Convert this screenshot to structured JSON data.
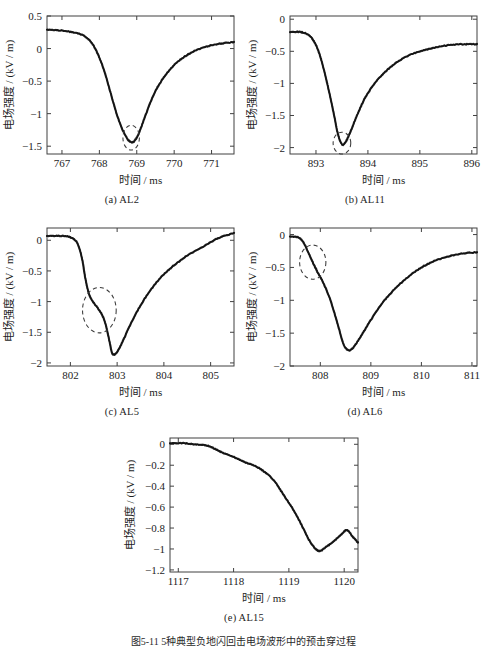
{
  "figure": {
    "caption": "图5-11  5种典型负地闪回击电场波形中的预击穿过程",
    "panel_count": 5
  },
  "common": {
    "xlabel": "时间 / ms",
    "ylabel": "电场强度 / (kV / m)",
    "annotation_name": "dashed-highlight-circle",
    "line_color": "#111111",
    "axis_color": "#404040"
  },
  "chart_data": [
    {
      "type": "line",
      "id": "AL2",
      "panel_label": "(a) AL2",
      "title": "",
      "xlabel": "时间 / ms",
      "ylabel": "电场强度 / (kV / m)",
      "xlim": [
        766.6,
        771.6
      ],
      "ylim": [
        -1.62,
        0.5
      ],
      "xticks": [
        767,
        768,
        769,
        770,
        771
      ],
      "yticks": [
        0.5,
        0,
        -0.5,
        -1,
        -1.5
      ],
      "ytick_labels": [
        "0.5",
        "0",
        "-0.5",
        "-1",
        "-1.5"
      ],
      "grid": false,
      "legend": "none",
      "annotation": {
        "shape": "dashed-ellipse",
        "x_center": 768.85,
        "y_center": -1.37,
        "x_radius": 0.22,
        "y_radius": 0.19,
        "note": "preliminary breakdown pulse at waveform trough"
      },
      "x": [
        766.6,
        766.9,
        767.2,
        767.5,
        767.7,
        767.85,
        768.0,
        768.15,
        768.3,
        768.45,
        768.6,
        768.72,
        768.8,
        768.88,
        768.95,
        769.05,
        769.2,
        769.4,
        769.6,
        769.85,
        770.1,
        770.4,
        770.7,
        771.0,
        771.3,
        771.6
      ],
      "y": [
        0.29,
        0.28,
        0.26,
        0.22,
        0.15,
        0.04,
        -0.14,
        -0.38,
        -0.68,
        -0.98,
        -1.22,
        -1.36,
        -1.42,
        -1.44,
        -1.41,
        -1.31,
        -1.08,
        -0.78,
        -0.55,
        -0.35,
        -0.2,
        -0.08,
        0.0,
        0.05,
        0.08,
        0.1
      ]
    },
    {
      "type": "line",
      "id": "AL11",
      "panel_label": "(b) AL11",
      "title": "",
      "xlabel": "时间 / ms",
      "ylabel": "电场强度 / (kV / m)",
      "xlim": [
        892.5,
        896.1
      ],
      "ylim": [
        -2.1,
        0.05
      ],
      "xticks": [
        893,
        894,
        895,
        896
      ],
      "yticks": [
        0,
        -0.5,
        -1,
        -1.5,
        -2
      ],
      "ytick_labels": [
        "0",
        "-0.5",
        "-1",
        "-1.5",
        "-2"
      ],
      "grid": false,
      "legend": "none",
      "annotation": {
        "shape": "dashed-ellipse",
        "x_center": 893.5,
        "y_center": -1.93,
        "x_radius": 0.17,
        "y_radius": 0.17,
        "note": "preliminary breakdown pulse at waveform trough"
      },
      "x": [
        892.5,
        892.7,
        892.85,
        892.95,
        893.05,
        893.15,
        893.25,
        893.35,
        893.42,
        893.5,
        893.58,
        893.68,
        893.8,
        893.95,
        894.15,
        894.4,
        894.7,
        895.0,
        895.3,
        895.6,
        895.85,
        896.1
      ],
      "y": [
        -0.2,
        -0.2,
        -0.24,
        -0.33,
        -0.5,
        -0.78,
        -1.12,
        -1.5,
        -1.78,
        -1.95,
        -1.9,
        -1.72,
        -1.48,
        -1.22,
        -0.98,
        -0.77,
        -0.6,
        -0.5,
        -0.44,
        -0.4,
        -0.39,
        -0.39
      ]
    },
    {
      "type": "line",
      "id": "AL5",
      "panel_label": "(c) AL5",
      "title": "",
      "xlabel": "时间 / ms",
      "ylabel": "电场强度 / (kV / m)",
      "xlim": [
        801.5,
        805.5
      ],
      "ylim": [
        -2.05,
        0.2
      ],
      "xticks": [
        802,
        803,
        804,
        805
      ],
      "yticks": [
        0,
        -0.5,
        -1,
        -1.5,
        -2
      ],
      "ytick_labels": [
        "0",
        "-0.5",
        "-1",
        "-1.5",
        "-2"
      ],
      "grid": false,
      "legend": "none",
      "annotation": {
        "shape": "dashed-ellipse",
        "x_center": 802.62,
        "y_center": -1.14,
        "x_radius": 0.36,
        "y_radius": 0.37,
        "note": "pronounced preliminary breakdown step on leading edge"
      },
      "x": [
        801.5,
        801.8,
        802.0,
        802.15,
        802.25,
        802.32,
        802.4,
        802.5,
        802.6,
        802.7,
        802.78,
        802.85,
        802.9,
        802.98,
        803.1,
        803.3,
        803.55,
        803.85,
        804.15,
        804.5,
        804.85,
        805.15,
        805.5
      ],
      "y": [
        0.07,
        0.07,
        0.05,
        -0.05,
        -0.3,
        -0.62,
        -0.88,
        -1.02,
        -1.12,
        -1.25,
        -1.45,
        -1.7,
        -1.85,
        -1.84,
        -1.68,
        -1.35,
        -1.0,
        -0.68,
        -0.45,
        -0.25,
        -0.1,
        0.03,
        0.12
      ]
    },
    {
      "type": "line",
      "id": "AL6",
      "panel_label": "(d) AL6",
      "title": "",
      "xlabel": "时间 / ms",
      "ylabel": "电场强度 / (kV / m)",
      "xlim": [
        807.4,
        811.1
      ],
      "ylim": [
        -2.0,
        0.1
      ],
      "xticks": [
        808,
        809,
        810,
        811
      ],
      "yticks": [
        0,
        -0.5,
        -1,
        -1.5,
        -2
      ],
      "ytick_labels": [
        "0",
        "-0.5",
        "-1",
        "-1.5",
        "-2"
      ],
      "grid": false,
      "legend": "none",
      "annotation": {
        "shape": "dashed-ellipse",
        "x_center": 807.85,
        "y_center": -0.42,
        "x_radius": 0.26,
        "y_radius": 0.26,
        "note": "preliminary breakdown step on leading edge"
      },
      "x": [
        807.4,
        807.55,
        807.65,
        807.75,
        807.85,
        807.95,
        808.05,
        808.2,
        808.35,
        808.45,
        808.55,
        808.65,
        808.8,
        809.0,
        809.25,
        809.55,
        809.9,
        810.2,
        810.5,
        810.8,
        811.1
      ],
      "y": [
        -0.03,
        -0.04,
        -0.1,
        -0.25,
        -0.42,
        -0.58,
        -0.72,
        -1.0,
        -1.38,
        -1.65,
        -1.76,
        -1.72,
        -1.55,
        -1.3,
        -1.02,
        -0.77,
        -0.55,
        -0.42,
        -0.34,
        -0.29,
        -0.27
      ]
    },
    {
      "type": "line",
      "id": "AL15",
      "panel_label": "(e) AL15",
      "title": "",
      "xlabel": "时间 / ms",
      "ylabel": "电场强度 / (kV / m)",
      "xlim": [
        1116.85,
        1120.25
      ],
      "ylim": [
        -1.22,
        0.06
      ],
      "xticks": [
        1117,
        1118,
        1119,
        1120
      ],
      "yticks": [
        0,
        -0.2,
        -0.4,
        -0.6,
        -0.8,
        -1,
        -1.2
      ],
      "ytick_labels": [
        "0",
        "-0.2",
        "-0.4",
        "-0.6",
        "-0.8",
        "-1",
        "-1.2"
      ],
      "grid": false,
      "legend": "none",
      "annotation": null,
      "x": [
        1116.85,
        1117.1,
        1117.3,
        1117.5,
        1117.65,
        1117.8,
        1118.0,
        1118.2,
        1118.4,
        1118.6,
        1118.75,
        1118.9,
        1119.05,
        1119.2,
        1119.35,
        1119.45,
        1119.55,
        1119.65,
        1119.8,
        1119.95,
        1120.05,
        1120.15,
        1120.25
      ],
      "y": [
        0.01,
        0.01,
        0.0,
        -0.01,
        -0.04,
        -0.08,
        -0.12,
        -0.17,
        -0.21,
        -0.28,
        -0.36,
        -0.48,
        -0.6,
        -0.74,
        -0.9,
        -0.98,
        -1.02,
        -0.99,
        -0.93,
        -0.86,
        -0.82,
        -0.88,
        -0.94
      ]
    }
  ]
}
